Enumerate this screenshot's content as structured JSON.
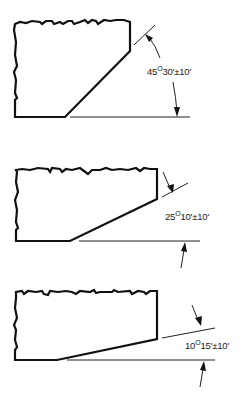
{
  "figures": [
    {
      "id": "chamfer-45",
      "angle_deg": 45,
      "angle_min": "30'",
      "tolerance": "±10'",
      "label_deg": "45",
      "label_degree_symbol": "O",
      "label_rest": "30'±10'"
    },
    {
      "id": "chamfer-25",
      "angle_deg": 25,
      "angle_min": "10'",
      "tolerance": "±10'",
      "label_deg": "25",
      "label_degree_symbol": "O",
      "label_rest": "10'±10'"
    },
    {
      "id": "chamfer-10",
      "angle_deg": 10,
      "angle_min": "15'",
      "tolerance": "±10'",
      "label_deg": "10",
      "label_degree_symbol": "O",
      "label_rest": "15'±10'"
    }
  ],
  "colors": {
    "line": "#111111",
    "background": "#ffffff"
  }
}
